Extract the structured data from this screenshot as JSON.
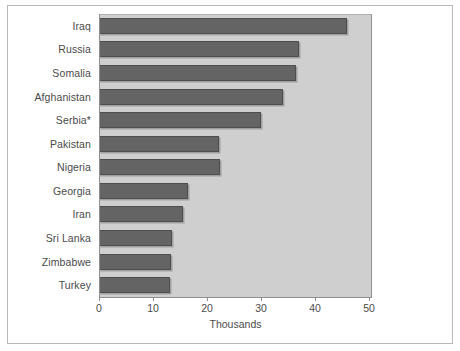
{
  "chart_data": {
    "type": "bar",
    "orientation": "horizontal",
    "title": "",
    "xlabel": "Thousands",
    "ylabel": "",
    "xlim": [
      0,
      50
    ],
    "xticks": [
      0,
      10,
      20,
      30,
      40,
      50
    ],
    "xtick_labels": [
      "0",
      "10",
      "20",
      "30",
      "40",
      "50"
    ],
    "grid": false,
    "legend": false,
    "categories": [
      "Iraq",
      "Russia",
      "Somalia",
      "Afghanistan",
      "Serbia*",
      "Pakistan",
      "Nigeria",
      "Georgia",
      "Iran",
      "Sri Lanka",
      "Zimbabwe",
      "Turkey"
    ],
    "values": [
      46.0,
      37.0,
      36.5,
      34.0,
      30.0,
      22.2,
      22.4,
      16.5,
      15.5,
      13.5,
      13.4,
      13.2
    ],
    "bar_color": "#646464",
    "plot_background": "#cfcfcf",
    "figure_background": "#ffffff"
  },
  "axis": {
    "x_title": "Thousands"
  }
}
